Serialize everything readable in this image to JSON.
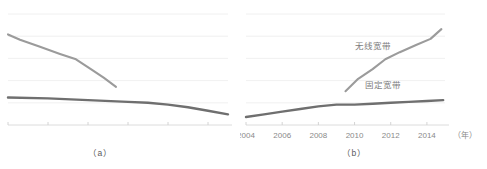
{
  "figure": {
    "panel_a": {
      "caption": "（a）"
    },
    "panel_b": {
      "caption": "（b）"
    }
  },
  "chart_data": [
    {
      "id": "panel-a",
      "type": "line",
      "title": "",
      "xlabel": "",
      "ylabel": "",
      "ylim": [
        0,
        125
      ],
      "yticks": [
        0,
        25,
        50,
        75,
        100,
        125
      ],
      "ytick_labels": [
        "0%",
        "25%",
        "50%",
        "75%",
        "100%",
        "125%"
      ],
      "ytick_labels_visible": false,
      "xlim": [
        2004,
        2015
      ],
      "xticks": [
        2004,
        2006,
        2008,
        2010,
        2012,
        2014
      ],
      "xtick_labels": [
        "",
        "",
        "",
        "",
        "",
        ""
      ],
      "grid": true,
      "legend": "none",
      "series": [
        {
          "name": "declining-upper",
          "color": "#9b9b9b",
          "x": [
            2004,
            2004.6,
            2005.6,
            2006.6,
            2007.4,
            2008.2,
            2008.8,
            2009.4
          ],
          "values": [
            102,
            96,
            88,
            80,
            74,
            62,
            53,
            43
          ]
        },
        {
          "name": "declining-lower",
          "color": "#6f6f6f",
          "x": [
            2004,
            2006,
            2008,
            2010,
            2011,
            2012,
            2013,
            2014,
            2015
          ],
          "values": [
            31,
            30,
            28,
            26,
            25,
            23,
            20,
            16,
            12
          ]
        }
      ]
    },
    {
      "id": "panel-b",
      "type": "line",
      "title": "",
      "xlabel": "（年）",
      "ylabel": "",
      "ylim": [
        0,
        125
      ],
      "yticks": [
        0,
        25,
        50,
        75,
        100,
        125
      ],
      "ytick_labels": [
        "0%",
        "25%",
        "50%",
        "75%",
        "100%",
        "125%"
      ],
      "ytick_labels_visible": true,
      "xlim": [
        2004,
        2015
      ],
      "xticks": [
        2004,
        2006,
        2008,
        2010,
        2012,
        2014
      ],
      "xtick_labels": [
        "2004",
        "2006",
        "2008",
        "2010",
        "2012",
        "2014"
      ],
      "x_unit": "（年）",
      "grid": true,
      "legend": "inline-annotations",
      "series": [
        {
          "name": "无线宽带",
          "label": "无线宽带",
          "color": "#9b9b9b",
          "label_x": 2011.0,
          "label_y": 86,
          "x": [
            2009.5,
            2010.2,
            2011.0,
            2011.7,
            2012.5,
            2013.4,
            2014.2,
            2014.8
          ],
          "values": [
            38,
            52,
            63,
            74,
            82,
            90,
            97,
            108
          ]
        },
        {
          "name": "固定宽带",
          "label": "固定宽带",
          "color": "#6f6f6f",
          "label_x": 2011.6,
          "label_y": 42,
          "x": [
            2004,
            2005,
            2006,
            2007,
            2008,
            2009,
            2010,
            2011,
            2012,
            2013,
            2014,
            2014.9
          ],
          "values": [
            9,
            12,
            15,
            18,
            21,
            23,
            23,
            24,
            25,
            26,
            27,
            28
          ]
        }
      ]
    }
  ]
}
